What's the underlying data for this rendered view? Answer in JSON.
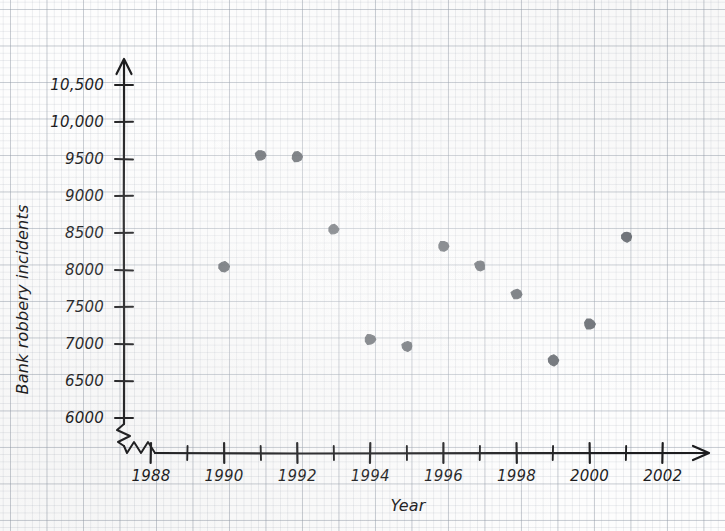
{
  "chart_data": {
    "type": "scatter",
    "title": "",
    "xlabel": "Year",
    "ylabel": "Bank robbery incidents",
    "xlim": [
      1987.6,
      2002.6
    ],
    "ylim": [
      5850,
      10700
    ],
    "grid": true,
    "legend": "none",
    "axis_break": {
      "axis": "y",
      "note": "zigzag break between 0 and 6000 on the vertical axis"
    },
    "x_ticks_major": [
      1988,
      1990,
      1992,
      1994,
      1996,
      1998,
      2000,
      2002
    ],
    "x_ticks_minor": [
      1989,
      1991,
      1993,
      1995,
      1997,
      1999,
      2001
    ],
    "y_ticks": [
      6000,
      6500,
      7000,
      7500,
      8000,
      8500,
      9000,
      9500,
      10000,
      10500
    ],
    "y_tick_labels": [
      "6000",
      "6500",
      "7000",
      "7500",
      "8000",
      "8500",
      "9000",
      "9500",
      "10,000",
      "10,500"
    ],
    "x": [
      1990,
      1991,
      1992,
      1993,
      1994,
      1995,
      1996,
      1997,
      1998,
      1999,
      2000,
      2001
    ],
    "values": [
      8050,
      9550,
      9530,
      8550,
      7060,
      6970,
      8320,
      8060,
      7670,
      6780,
      7270,
      8450
    ],
    "points": [
      {
        "year": 1990,
        "incidents": 8050
      },
      {
        "year": 1991,
        "incidents": 9550
      },
      {
        "year": 1992,
        "incidents": 9530
      },
      {
        "year": 1993,
        "incidents": 8550
      },
      {
        "year": 1994,
        "incidents": 7060
      },
      {
        "year": 1995,
        "incidents": 6970
      },
      {
        "year": 1996,
        "incidents": 8320
      },
      {
        "year": 1997,
        "incidents": 8060
      },
      {
        "year": 1998,
        "incidents": 7670
      },
      {
        "year": 1999,
        "incidents": 6780
      },
      {
        "year": 2000,
        "incidents": 7270
      },
      {
        "year": 2001,
        "incidents": 8450
      }
    ],
    "marker_color": "#555a60",
    "axis_color": "#1d1d1f",
    "grid_color": "#969eaa"
  }
}
